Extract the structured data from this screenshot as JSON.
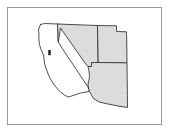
{
  "figure": {
    "title": "",
    "caption": "",
    "background_color": "#ffffff",
    "frame": {
      "name": "map-frame",
      "border_color": "#9a9a9a",
      "fill_color": "#ffffff",
      "x": 7,
      "y": 7,
      "width": 155,
      "height": 118
    }
  },
  "map": {
    "region_label": "",
    "projection_note": "",
    "outline_color": "#3a3a3a",
    "highlight_fill": "#dcdcdc",
    "unhighlighted_fill": "#ffffff",
    "states": [
      {
        "name": "California",
        "abbr": "CA",
        "label": "",
        "highlighted": false,
        "fill": "#ffffff",
        "path": "M40.5,24.5 L44.5,23.5 L57.5,24.0 L57.8,30.0 L58.0,36.0 L58.3,42.0 L62.0,48.0 L66.0,54.0 L70.0,60.0 L74.0,66.0 L78.0,72.0 L82.0,78.0 L86.0,84.0 L88.5,88.0 L89.5,91.5 L86.0,92.0 L80.5,93.0 L76.0,94.5 L71.5,96.0 L68.0,97.0 L64.5,95.0 L61.0,92.5 L58.0,89.5 L55.5,86.5 L53.0,83.0 L50.5,79.0 L48.5,75.0 L47.0,71.0 L45.5,67.0 L44.5,63.0 L44.0,59.0 L43.5,55.0 L42.0,51.5 L40.5,48.0 L39.5,44.5 L39.0,41.0 L38.8,37.5 L39.0,34.0 L38.5,31.0 L39.0,28.0 L40.5,24.5 Z"
      },
      {
        "name": "Nevada",
        "abbr": "NV",
        "label": "",
        "highlighted": true,
        "fill": "#dcdcdc",
        "path": "M57.5,24.0 L97.5,25.5 L97.8,40.0 L98.0,54.0 L98.2,62.5 L94.5,62.5 L91.5,62.5 L91.5,66.5 L88.0,66.5 L85.0,63.0 L81.5,58.0 L78.0,53.0 L74.5,48.0 L71.0,43.0 L67.5,38.0 L64.0,33.0 L60.5,28.0 L58.3,42.0 L58.0,36.0 L57.8,30.0 L57.5,24.0 Z"
      },
      {
        "name": "Utah",
        "abbr": "UT",
        "label": "",
        "highlighted": true,
        "fill": "#dcdcdc",
        "path": "M97.5,25.5 L116.5,25.8 L116.6,31.5 L126.5,31.8 L126.8,46.0 L127.0,62.8 L112.5,62.7 L98.2,62.5 L98.0,54.0 L97.8,40.0 L97.5,25.5 Z"
      },
      {
        "name": "Arizona",
        "abbr": "AZ",
        "label": "",
        "highlighted": true,
        "fill": "#dcdcdc",
        "path": "M98.2,62.5 L112.5,62.7 L127.0,62.8 L127.2,79.0 L127.4,95.5 L127.5,107.5 L118.0,106.0 L108.0,104.0 L99.0,102.0 L93.5,98.5 L89.5,91.5 L88.5,88.0 L88.0,84.0 L89.0,80.0 L89.5,75.5 L89.0,71.0 L88.0,66.5 L91.5,66.5 L91.5,62.5 L94.5,62.5 L98.2,62.5 Z"
      }
    ],
    "features": [
      {
        "name": "san-francisco-bay",
        "label": "",
        "x": 48.2,
        "y": 50.0,
        "width": 2.6,
        "height": 5.2,
        "fill": "#2b2b2b"
      }
    ]
  },
  "chart_data": {
    "type": "map",
    "title": "",
    "subtitle": "",
    "xlabel": "",
    "ylabel": "",
    "legend": [],
    "categories": [
      "California",
      "Nevada",
      "Utah",
      "Arizona"
    ],
    "series": [
      {
        "name": "highlighted",
        "values": [
          0,
          1,
          1,
          1
        ]
      }
    ],
    "annotations": [],
    "grid": false,
    "legend_position": "none"
  }
}
